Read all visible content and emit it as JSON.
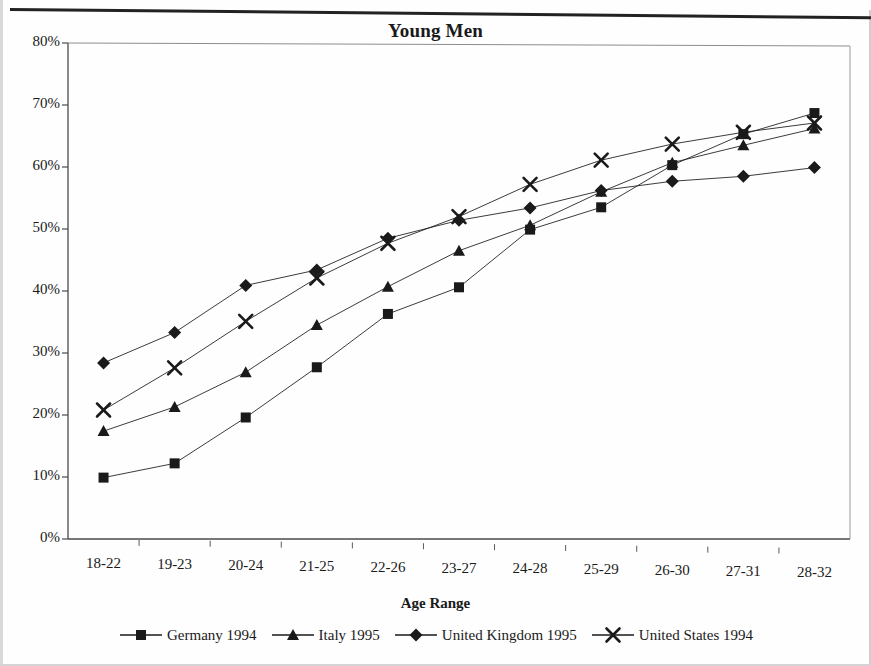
{
  "chart_data": {
    "type": "line",
    "title": "Young Men",
    "xlabel": "Age Range",
    "ylabel": "",
    "ylim": [
      0,
      80
    ],
    "ytick_labels": [
      "0%",
      "10%",
      "20%",
      "30%",
      "40%",
      "50%",
      "60%",
      "70%",
      "80%"
    ],
    "ytick_values": [
      0,
      10,
      20,
      30,
      40,
      50,
      60,
      70,
      80
    ],
    "grid": false,
    "legend_position": "bottom",
    "categories": [
      "18-22",
      "19-23",
      "20-24",
      "21-25",
      "22-26",
      "23-27",
      "24-28",
      "25-29",
      "26-30",
      "27-31",
      "28-32"
    ],
    "series": [
      {
        "name": "Germany 1994",
        "marker": "square",
        "color": "#1a1a1a",
        "values": [
          9.9,
          12.2,
          19.6,
          27.7,
          36.3,
          40.6,
          49.9,
          53.5,
          60.3,
          65.3,
          68.7
        ]
      },
      {
        "name": "Italy 1995",
        "marker": "triangle",
        "color": "#1a1a1a",
        "values": [
          17.4,
          21.3,
          26.9,
          34.5,
          40.7,
          46.5,
          50.6,
          56.0,
          60.7,
          63.5,
          66.2
        ]
      },
      {
        "name": "United Kingdom 1995",
        "marker": "diamond",
        "color": "#1a1a1a",
        "values": [
          28.4,
          33.3,
          40.9,
          43.4,
          48.5,
          51.4,
          53.4,
          56.2,
          57.7,
          58.5,
          59.9
        ]
      },
      {
        "name": "United States 1994",
        "marker": "cross",
        "color": "#1a1a1a",
        "values": [
          20.8,
          27.6,
          35.1,
          42.1,
          47.7,
          52.0,
          57.2,
          61.1,
          63.7,
          65.6,
          67.1
        ]
      }
    ]
  },
  "legend": {
    "entries": [
      {
        "label": "Germany 1994",
        "marker": "square"
      },
      {
        "label": "Italy 1995",
        "marker": "triangle"
      },
      {
        "label": "United Kingdom 1995",
        "marker": "diamond"
      },
      {
        "label": "United States 1994",
        "marker": "cross"
      }
    ]
  }
}
